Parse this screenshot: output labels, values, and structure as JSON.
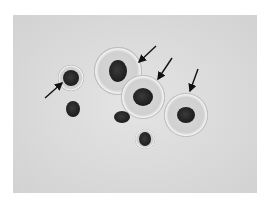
{
  "image": {
    "description": "Grayscale light micrograph of rounded cells with dark nuclei; arrows point to cell membranes",
    "background_color": "#dcdcdc",
    "frame_color": "#ffffff",
    "cells": [
      {
        "id": "cell-small-left-top",
        "cx": 71,
        "cy": 78,
        "r": 13,
        "nucleus_rx": 8,
        "nucleus_ry": 8
      },
      {
        "id": "cell-small-left-bottom",
        "cx": 73,
        "cy": 109,
        "r": 0,
        "nucleus_rx": 7,
        "nucleus_ry": 8
      },
      {
        "id": "cell-large-top",
        "cx": 118,
        "cy": 71,
        "r": 24,
        "nucleus_rx": 9,
        "nucleus_ry": 11
      },
      {
        "id": "cell-center",
        "cx": 143,
        "cy": 97,
        "r": 22,
        "nucleus_rx": 10,
        "nucleus_ry": 9
      },
      {
        "id": "cell-right",
        "cx": 186,
        "cy": 115,
        "r": 22,
        "nucleus_rx": 9,
        "nucleus_ry": 8
      },
      {
        "id": "cell-small-mid",
        "cx": 122,
        "cy": 117,
        "r": 0,
        "nucleus_rx": 8,
        "nucleus_ry": 6
      },
      {
        "id": "cell-small-bottom",
        "cx": 145,
        "cy": 139,
        "r": 10,
        "nucleus_rx": 6,
        "nucleus_ry": 7
      }
    ],
    "arrows": [
      {
        "id": "arrow-left",
        "x1": 45,
        "y1": 98,
        "x2": 62,
        "y2": 83
      },
      {
        "id": "arrow-top",
        "x1": 156,
        "y1": 46,
        "x2": 139,
        "y2": 62
      },
      {
        "id": "arrow-middle",
        "x1": 172,
        "y1": 58,
        "x2": 158,
        "y2": 79
      },
      {
        "id": "arrow-right",
        "x1": 198,
        "y1": 69,
        "x2": 190,
        "y2": 91
      }
    ]
  }
}
